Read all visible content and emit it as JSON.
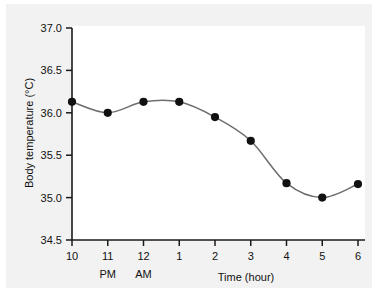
{
  "chart_data": {
    "type": "line",
    "title": "",
    "xlabel": "Time (hour)",
    "ylabel": "Body temperature (°C)",
    "x_tick_labels": [
      "10",
      "11",
      "12",
      "1",
      "2",
      "3",
      "4",
      "5",
      "6"
    ],
    "x_sub_labels": [
      "",
      "PM",
      "AM",
      "",
      "",
      "",
      "",
      "",
      ""
    ],
    "y_tick_labels": [
      "37.0",
      "36.5",
      "36.0",
      "35.5",
      "35.0",
      "34.5"
    ],
    "ylim": [
      34.5,
      37.0
    ],
    "y_tick_step": 0.5,
    "grid": false,
    "legend": "none",
    "marker": "filled-circle",
    "line_color": "#6e6e6e",
    "marker_color": "#111111",
    "categories": [
      "10 PM",
      "11 PM",
      "12 AM",
      "1",
      "2",
      "3",
      "4",
      "5",
      "6"
    ],
    "values": [
      36.13,
      36.0,
      36.13,
      36.13,
      35.95,
      35.67,
      35.17,
      35.0,
      35.16
    ],
    "points": [
      {
        "x_label": "10",
        "value": 36.13
      },
      {
        "x_label": "11",
        "value": 36.0
      },
      {
        "x_label": "12",
        "value": 36.13
      },
      {
        "x_label": "1",
        "value": 36.13
      },
      {
        "x_label": "2",
        "value": 35.95
      },
      {
        "x_label": "3",
        "value": 35.67
      },
      {
        "x_label": "4",
        "value": 35.17
      },
      {
        "x_label": "5",
        "value": 35.0
      },
      {
        "x_label": "6",
        "value": 35.16
      }
    ]
  }
}
